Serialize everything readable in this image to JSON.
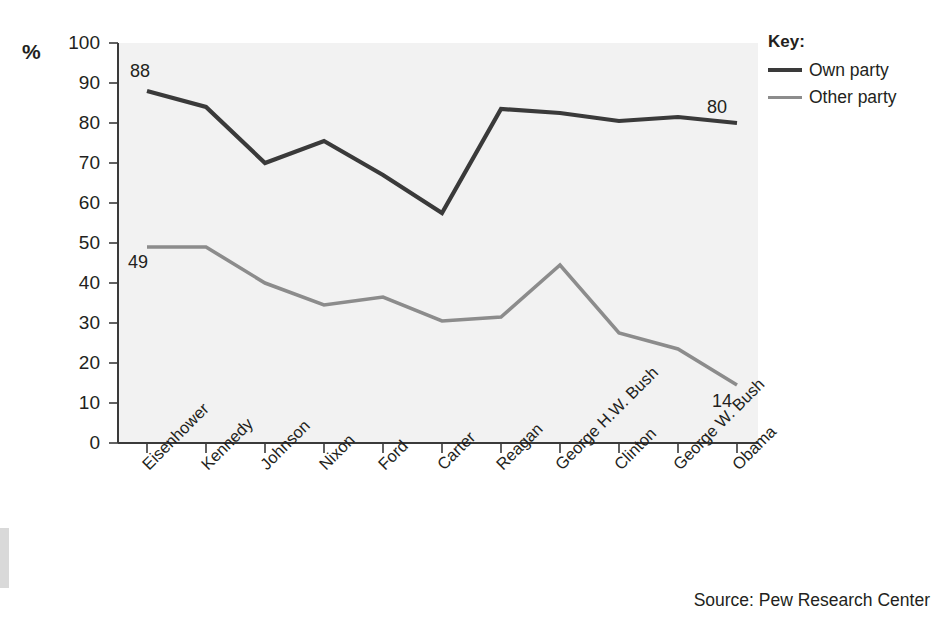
{
  "figure": {
    "unit_label": "%",
    "source": "Source: Pew Research Center",
    "background_color": "#ffffff",
    "plot_background_color": "#f2f2f2"
  },
  "legend": {
    "title": "Key:",
    "position": "top-right",
    "entries": [
      {
        "label": "Own party",
        "color": "#3a3a3a"
      },
      {
        "label": "Other party",
        "color": "#8c8c8c"
      }
    ]
  },
  "annotations": [
    {
      "text": "88",
      "series": "Own party",
      "category": "Eisenhower",
      "x": 130,
      "y": 62
    },
    {
      "text": "80",
      "series": "Own party",
      "category": "Obama",
      "x": 707,
      "y": 98
    },
    {
      "text": "49",
      "series": "Other party",
      "category": "Eisenhower",
      "x": 128,
      "y": 253
    },
    {
      "text": "14",
      "series": "Other party",
      "category": "Obama",
      "x": 712,
      "y": 392
    }
  ],
  "chart_data": {
    "type": "line",
    "title": "",
    "subtitle": "",
    "xlabel": "",
    "ylabel": "%",
    "ylim": [
      0,
      100
    ],
    "yticks": [
      0,
      10,
      20,
      30,
      40,
      50,
      60,
      70,
      80,
      90,
      100
    ],
    "grid": false,
    "legend_position": "top-right",
    "source": "Source: Pew Research Center",
    "categories": [
      "Eisenhower",
      "Kennedy",
      "Johnson",
      "Nixon",
      "Ford",
      "Carter",
      "Reagan",
      "George H.W. Bush",
      "Clinton",
      "George W. Bush",
      "Obama"
    ],
    "series": [
      {
        "name": "Own party",
        "color": "#3a3a3a",
        "values": [
          88,
          84,
          70,
          75.5,
          67,
          57.5,
          83.5,
          82.5,
          80.5,
          81.5,
          80
        ]
      },
      {
        "name": "Other party",
        "color": "#8c8c8c",
        "values": [
          49,
          49,
          40,
          34.5,
          36.5,
          30.5,
          31.5,
          44.5,
          27.5,
          23.5,
          14.5
        ]
      }
    ]
  }
}
